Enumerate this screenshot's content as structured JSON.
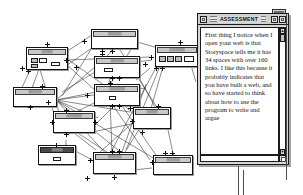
{
  "application": {
    "name": "Storyspace",
    "view": "map-view"
  },
  "assessment_window": {
    "title": "ASSESSMENT",
    "close_button_label": "",
    "zoom_button_label": "",
    "grow_button_label": "",
    "scroll_up_glyph": "▲",
    "scroll_down_glyph": "▼",
    "body_text": "First thing I notice when I open your web is that Storyspace tells me it has 34 spaces with over 160 links. I like this because it probably indicates that you have built a web, and so have started to think about how to use the program to write and argue",
    "stats_mentioned": {
      "spaces": 34,
      "links": 160
    }
  },
  "map": {
    "title": "Storyspace map view",
    "note": "Writing-space boxes connected by link lines; titles render as unreadable micro-text at this resolution.",
    "spaces": [
      {
        "id": "s1",
        "label": "▒▒▒▒▒",
        "selected": false
      },
      {
        "id": "s2",
        "label": "▒▒▒▒▒▒",
        "selected": false
      },
      {
        "id": "s3",
        "label": "▒▒▒▒▒▒",
        "selected": false
      },
      {
        "id": "s4",
        "label": "▒▒▒▒▒▒▒",
        "selected": false
      },
      {
        "id": "s5",
        "label": "▒▒▒▒▒▒▒",
        "selected": false
      },
      {
        "id": "s6",
        "label": "▒▒▒▒▒▒",
        "selected": false
      },
      {
        "id": "s7",
        "label": "▒▒▒▒▒▒▒",
        "selected": false
      },
      {
        "id": "s8",
        "label": "▒▒▒▒▒",
        "selected": false
      },
      {
        "id": "s9",
        "label": "▒▒▒▒▒▒",
        "selected": false
      },
      {
        "id": "s10",
        "label": "▒▒▒▒▒",
        "selected": true
      },
      {
        "id": "s11",
        "label": "▒▒▒▒▒▒",
        "selected": false
      },
      {
        "id": "s12",
        "label": "▒▒▒▒▒▒▒",
        "selected": false
      }
    ]
  }
}
